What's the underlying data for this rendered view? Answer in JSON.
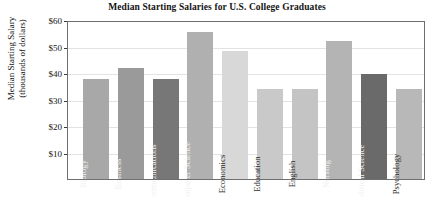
{
  "chart_data": {
    "type": "bar",
    "title": "Median Starting Salaries for U.S. College Graduates",
    "xlabel": "",
    "ylabel_line1": "Median Starting Salary",
    "ylabel_line2": "(thousands of dollars)",
    "ylim": [
      0,
      60
    ],
    "ytick_values": [
      10,
      20,
      30,
      40,
      50,
      60
    ],
    "ytick_labels": [
      "$10",
      "$20",
      "$30",
      "$40",
      "$50",
      "$60"
    ],
    "grid": true,
    "legend": "none",
    "categories": [
      "Biology",
      "Business",
      "Communications",
      "Computer Science",
      "Economics",
      "Education",
      "English",
      "Nursing",
      "Political Science",
      "Psychology"
    ],
    "values": [
      37.6,
      42.0,
      37.6,
      55.5,
      48.3,
      34.1,
      34.1,
      52.0,
      39.5,
      34.1
    ],
    "bar_colors": [
      "#a8a8a8",
      "#9a9a9a",
      "#777777",
      "#b0b0b0",
      "#d8d8d8",
      "#c9c9c9",
      "#c4c4c4",
      "#b4b4b4",
      "#6a6a6a",
      "#b8b8b8"
    ],
    "bar_label_tone": [
      "dark",
      "dark",
      "dark",
      "dark",
      "light",
      "light",
      "light",
      "dark",
      "dark",
      "light"
    ]
  }
}
